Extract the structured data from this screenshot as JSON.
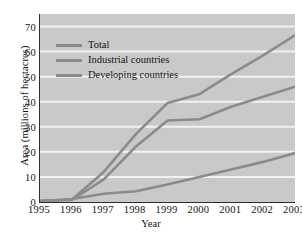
{
  "chart_data": {
    "type": "line",
    "title": "",
    "xlabel": "Year",
    "ylabel": "Area (millions of hectacres)",
    "x": [
      1995,
      1996,
      1997,
      1998,
      1999,
      2000,
      2001,
      2002,
      2003
    ],
    "xlim": [
      1995,
      2003
    ],
    "ylim": [
      0,
      75
    ],
    "yticks": [
      0,
      10,
      20,
      30,
      40,
      50,
      60,
      70
    ],
    "xticks": [
      "1995",
      "1996",
      "1997",
      "1998",
      "1999",
      "2000",
      "2001",
      "2002",
      "2003"
    ],
    "grid": "horizontal-white",
    "legend_position": "upper-left-inside",
    "series": [
      {
        "name": "Total",
        "color": "#8b8b8b",
        "values": [
          0.5,
          1.0,
          12.0,
          27.0,
          39.5,
          43.0,
          51.0,
          58.5,
          66.5
        ]
      },
      {
        "name": "Industrial countries",
        "color": "#8b8b8b",
        "values": [
          0.4,
          0.8,
          9.0,
          22.0,
          32.5,
          33.0,
          38.0,
          42.0,
          46.0
        ]
      },
      {
        "name": "Developing countries",
        "color": "#8b8b8b",
        "values": [
          0.2,
          1.2,
          3.3,
          4.3,
          7.0,
          10.0,
          13.0,
          16.0,
          19.5
        ]
      }
    ]
  },
  "legend": {
    "items": [
      {
        "label": "Total"
      },
      {
        "label": "Industrial countries"
      },
      {
        "label": "Developing countries"
      }
    ]
  },
  "colors": {
    "plot_background": "#c9c9c9",
    "gridline": "#f2f2f2",
    "axis": "#2e2e2e",
    "line": "#8b8b8b",
    "text": "#141414",
    "page_background": "#ffffff"
  }
}
